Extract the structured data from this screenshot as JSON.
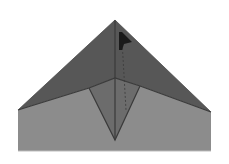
{
  "diagram": {
    "type": "origami-fold-step",
    "colors": {
      "background": "#ffffff",
      "top_flap": "#575757",
      "bottom_body": "#8c8c8c",
      "inner_triangle": "#6c6c6c",
      "crease_line": "#3a3a3a",
      "marker": "#1a1a1a"
    },
    "shapes": {
      "apex": [
        115,
        20
      ],
      "left_corner": [
        18,
        110
      ],
      "right_corner": [
        211,
        112
      ],
      "bottom_left": [
        18,
        151
      ],
      "bottom_right": [
        211,
        151
      ],
      "center_point": [
        115,
        78
      ],
      "inner_left": [
        89,
        88
      ],
      "inner_right": [
        140,
        86
      ],
      "inner_bottom": [
        115,
        140
      ]
    },
    "marker": {
      "shape": "flag-arrow",
      "position": [
        122,
        38
      ]
    }
  }
}
